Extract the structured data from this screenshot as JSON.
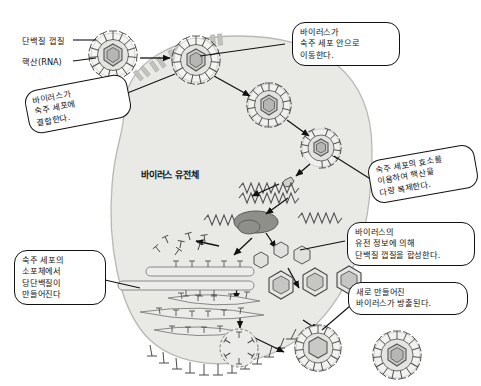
{
  "diagram": {
    "center_label": "바이러스 유전체",
    "colors": {
      "cell_fill": "#e9e9e6",
      "cell_stroke": "#b9b9b4",
      "virus_fill": "#f2f2f0",
      "capsid_fill": "#cfcfcc",
      "nucleus_fill": "#9a9a97",
      "outline": "#111111",
      "callout_bg": "#ffffff"
    },
    "labels": [
      {
        "id": "capsid",
        "text": "단백질 껍질"
      },
      {
        "id": "nucleic_acid",
        "text": "핵산(RNA)"
      }
    ],
    "callouts": [
      {
        "id": "binding",
        "text": "바이러스가\n숙주 세포에\n결합한다."
      },
      {
        "id": "entry",
        "text": "바이러스가\n숙주 세포 안으로\n이동한다."
      },
      {
        "id": "replication",
        "text": "숙주 세포의 효소를\n이용하여 핵산을\n다량 복제한다."
      },
      {
        "id": "synthesis",
        "text": "바이러스의\n유전 정보에 의해\n단백질 껍질을 합성한다."
      },
      {
        "id": "release",
        "text": "새로 만들어진\n바이러스가 방출된다."
      },
      {
        "id": "glycoprotein",
        "text": "숙주 세포의\n소포체에서\n당단백질이\n만들어진다"
      }
    ]
  }
}
